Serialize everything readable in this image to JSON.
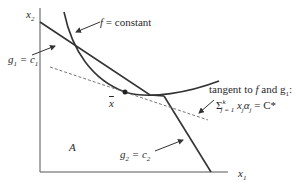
{
  "diagram": {
    "axes": {
      "x_label": "x",
      "x_sub": "1",
      "y_label": "x",
      "y_sub": "2"
    },
    "labels": {
      "f_constant": "f = constant",
      "g1_prefix": "g",
      "g1_sub": "1",
      "g1_eq": " = c",
      "g1_rhs_sub": "1",
      "g2_prefix": "g",
      "g2_sub": "2",
      "g2_eq": " = c",
      "g2_rhs_sub": "2",
      "xbar": "x",
      "region": "A",
      "tangent_line1": "tangent to f and g",
      "tangent_line1_sub": "1",
      "tangent_line1_end": ":",
      "sum_symbol": "Σ",
      "sum_sup": "k",
      "sum_sub": "j = 1",
      "sum_body": " x",
      "sum_body_sub": "j",
      "sum_alpha": "α",
      "sum_alpha_sub": "j",
      "sum_rhs": " = C*"
    },
    "colors": {
      "line": "#333333",
      "axis": "#555555",
      "dashed": "#777777"
    }
  }
}
